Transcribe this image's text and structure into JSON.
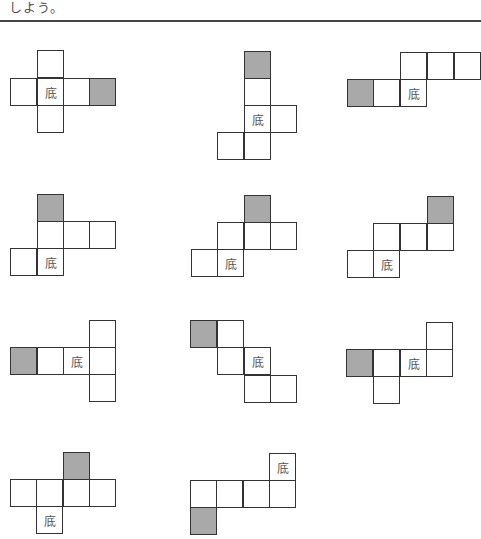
{
  "header": {
    "text": "しよう。"
  },
  "colors": {
    "shaded": "#a9a9a9",
    "line": "#333333"
  },
  "base_label": "底",
  "nets": [
    {
      "id": 1,
      "cells": [
        {
          "x": 37,
          "y": 50
        },
        {
          "x": 10,
          "y": 78
        },
        {
          "x": 37,
          "y": 78,
          "label": "底"
        },
        {
          "x": 63,
          "y": 78
        },
        {
          "x": 89,
          "y": 78,
          "shaded": true
        },
        {
          "x": 37,
          "y": 105
        }
      ]
    },
    {
      "id": 2,
      "cells": [
        {
          "x": 244,
          "y": 51,
          "shaded": true
        },
        {
          "x": 244,
          "y": 78
        },
        {
          "x": 244,
          "y": 105,
          "label": "底"
        },
        {
          "x": 270,
          "y": 105
        },
        {
          "x": 217,
          "y": 132
        },
        {
          "x": 244,
          "y": 132
        }
      ]
    },
    {
      "id": 3,
      "cells": [
        {
          "x": 400,
          "y": 52
        },
        {
          "x": 427,
          "y": 52
        },
        {
          "x": 454,
          "y": 52
        },
        {
          "x": 347,
          "y": 79,
          "shaded": true
        },
        {
          "x": 373,
          "y": 79
        },
        {
          "x": 400,
          "y": 79,
          "label": "底"
        }
      ]
    },
    {
      "id": 4,
      "cells": [
        {
          "x": 37,
          "y": 194,
          "shaded": true
        },
        {
          "x": 37,
          "y": 221
        },
        {
          "x": 63,
          "y": 221
        },
        {
          "x": 89,
          "y": 221
        },
        {
          "x": 10,
          "y": 248
        },
        {
          "x": 37,
          "y": 248,
          "label": "底"
        }
      ]
    },
    {
      "id": 5,
      "cells": [
        {
          "x": 244,
          "y": 195,
          "shaded": true
        },
        {
          "x": 217,
          "y": 222
        },
        {
          "x": 244,
          "y": 222
        },
        {
          "x": 270,
          "y": 222
        },
        {
          "x": 191,
          "y": 249
        },
        {
          "x": 217,
          "y": 249,
          "label": "底"
        }
      ]
    },
    {
      "id": 6,
      "cells": [
        {
          "x": 427,
          "y": 196,
          "shaded": true
        },
        {
          "x": 373,
          "y": 223
        },
        {
          "x": 400,
          "y": 223
        },
        {
          "x": 427,
          "y": 223
        },
        {
          "x": 347,
          "y": 250
        },
        {
          "x": 373,
          "y": 250,
          "label": "底"
        }
      ]
    },
    {
      "id": 7,
      "cells": [
        {
          "x": 89,
          "y": 320
        },
        {
          "x": 10,
          "y": 347,
          "shaded": true
        },
        {
          "x": 37,
          "y": 347
        },
        {
          "x": 63,
          "y": 347,
          "label": "底"
        },
        {
          "x": 89,
          "y": 347
        },
        {
          "x": 89,
          "y": 374
        }
      ]
    },
    {
      "id": 8,
      "cells": [
        {
          "x": 190,
          "y": 320,
          "shaded": true
        },
        {
          "x": 217,
          "y": 320
        },
        {
          "x": 217,
          "y": 347
        },
        {
          "x": 244,
          "y": 347,
          "label": "底"
        },
        {
          "x": 244,
          "y": 375
        },
        {
          "x": 270,
          "y": 375
        }
      ]
    },
    {
      "id": 9,
      "cells": [
        {
          "x": 426,
          "y": 322
        },
        {
          "x": 346,
          "y": 349,
          "shaded": true
        },
        {
          "x": 373,
          "y": 349
        },
        {
          "x": 400,
          "y": 349,
          "label": "底"
        },
        {
          "x": 426,
          "y": 349
        },
        {
          "x": 373,
          "y": 376
        }
      ]
    },
    {
      "id": 10,
      "cells": [
        {
          "x": 63,
          "y": 452,
          "shaded": true
        },
        {
          "x": 10,
          "y": 479
        },
        {
          "x": 36,
          "y": 479
        },
        {
          "x": 63,
          "y": 479
        },
        {
          "x": 89,
          "y": 479
        },
        {
          "x": 36,
          "y": 506,
          "label": "底"
        }
      ]
    },
    {
      "id": 11,
      "cells": [
        {
          "x": 269,
          "y": 453,
          "label": "底"
        },
        {
          "x": 190,
          "y": 480
        },
        {
          "x": 216,
          "y": 480
        },
        {
          "x": 243,
          "y": 480
        },
        {
          "x": 269,
          "y": 480
        },
        {
          "x": 190,
          "y": 507,
          "shaded": true
        }
      ]
    }
  ]
}
